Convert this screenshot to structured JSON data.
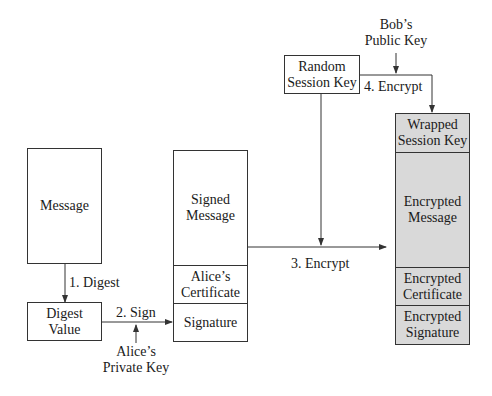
{
  "diagram": {
    "type": "signed-and-enveloped-message-flow",
    "nodes": {
      "message": "Message",
      "digest_value": [
        "Digest",
        "Value"
      ],
      "signed_message": [
        "Signed",
        "Message"
      ],
      "alice_certificate": [
        "Alice’s",
        "Certificate"
      ],
      "signature": "Signature",
      "random_session_key": [
        "Random",
        "Session Key"
      ],
      "wrapped_session_key": [
        "Wrapped",
        "Session Key"
      ],
      "encrypted_message": [
        "Encrypted",
        "Message"
      ],
      "encrypted_certificate": [
        "Encrypted",
        "Certificate"
      ],
      "encrypted_signature": [
        "Encrypted",
        "Signature"
      ]
    },
    "inputs": {
      "alice_private_key": [
        "Alice’s",
        "Private Key"
      ],
      "bob_public_key": [
        "Bob’s",
        "Public Key"
      ]
    },
    "steps": {
      "step1": "1. Digest",
      "step2": "2. Sign",
      "step3": "3. Encrypt",
      "step4": "4. Encrypt"
    },
    "colors": {
      "line": "#333333",
      "shaded_fill": "#d9d9d9",
      "text": "#1a1a1a"
    }
  }
}
